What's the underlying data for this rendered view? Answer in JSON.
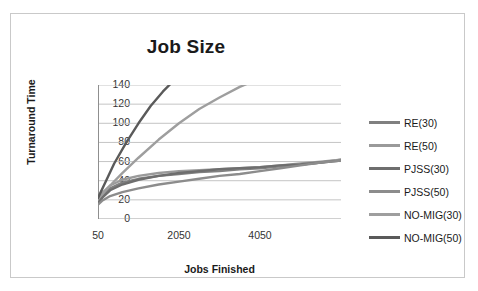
{
  "chart_data": {
    "type": "line",
    "title": "Job Size",
    "xlabel": "Jobs Finished",
    "ylabel": "Turnaround Time",
    "xlim": [
      50,
      6050
    ],
    "ylim": [
      0,
      140
    ],
    "yticks": [
      0,
      20,
      40,
      60,
      80,
      100,
      120,
      140
    ],
    "xticks": [
      50,
      2050,
      4050
    ],
    "xtick_labels": [
      "50",
      "2050",
      "4050"
    ],
    "grid": true,
    "legend_position": "right",
    "series": [
      {
        "name": "RE(30)",
        "color": "#808080",
        "x": [
          50,
          150,
          350,
          650,
          1050,
          1550,
          2050,
          2550,
          3050,
          3550,
          4050,
          4550,
          5050,
          5550,
          6050
        ],
        "y": [
          17,
          24,
          32,
          38,
          42,
          45,
          47,
          49,
          50,
          52,
          53,
          55,
          57,
          59,
          62
        ]
      },
      {
        "name": "RE(50)",
        "color": "#9a9a9a",
        "x": [
          50,
          150,
          350,
          650,
          1050,
          1550,
          2050,
          2550,
          3050,
          3550,
          4050,
          4550,
          5050,
          5550,
          6050
        ],
        "y": [
          20,
          27,
          35,
          41,
          45,
          48,
          50,
          51,
          52,
          53,
          54,
          56,
          58,
          60,
          62
        ]
      },
      {
        "name": "PJSS(30)",
        "color": "#6e6e6e",
        "x": [
          50,
          150,
          350,
          650,
          1050,
          1550,
          2050,
          2550,
          3050,
          3550,
          4050,
          4550,
          5050,
          5550,
          6050
        ],
        "y": [
          16,
          22,
          30,
          36,
          41,
          45,
          48,
          50,
          52,
          53,
          54,
          56,
          57,
          59,
          61
        ]
      },
      {
        "name": "PJSS(50)",
        "color": "#8c8c8c",
        "x": [
          50,
          150,
          350,
          650,
          1050,
          1550,
          2050,
          2550,
          3050,
          3550,
          4050,
          4550,
          5050,
          5550,
          6050
        ],
        "y": [
          15,
          19,
          24,
          28,
          32,
          36,
          39,
          42,
          45,
          47,
          50,
          53,
          56,
          59,
          61
        ]
      },
      {
        "name": "NO-MIG(30)",
        "color": "#9e9e9e",
        "x": [
          50,
          350,
          650,
          1050,
          1550,
          2050,
          2550,
          3050,
          3550,
          4050,
          4400
        ],
        "y": [
          21,
          35,
          48,
          64,
          83,
          100,
          115,
          127,
          138,
          147,
          152
        ],
        "clipped": true
      },
      {
        "name": "NO-MIG(50)",
        "color": "#5a5a5a",
        "x": [
          50,
          250,
          450,
          750,
          1050,
          1350,
          1650,
          1950,
          2150
        ],
        "y": [
          22,
          40,
          58,
          80,
          100,
          118,
          133,
          146,
          153
        ],
        "clipped": true
      }
    ]
  },
  "legend": {
    "items": [
      {
        "label": "RE(30)",
        "color": "#808080"
      },
      {
        "label": "RE(50)",
        "color": "#9a9a9a"
      },
      {
        "label": "PJSS(30)",
        "color": "#6e6e6e"
      },
      {
        "label": "PJSS(50)",
        "color": "#8c8c8c"
      },
      {
        "label": "NO-MIG(30)",
        "color": "#9e9e9e"
      },
      {
        "label": "NO-MIG(50)",
        "color": "#5a5a5a"
      }
    ]
  },
  "axis": {
    "y_labels": [
      "140",
      "120",
      "100",
      "80",
      "60",
      "40",
      "20",
      "0"
    ],
    "x_labels": [
      "50",
      "2050",
      "4050"
    ]
  }
}
